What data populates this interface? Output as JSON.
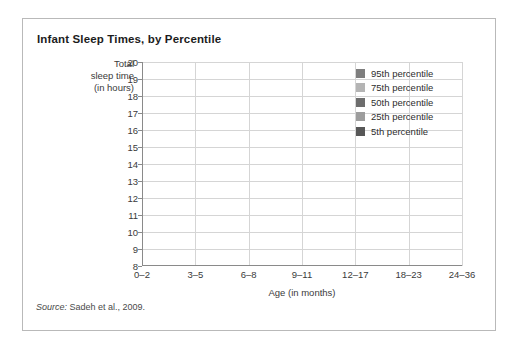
{
  "figure": {
    "title": "Infant Sleep Times, by Percentile",
    "source_label": "Source:",
    "source_text": " Sadeh et al., 2009."
  },
  "axes": {
    "y_title_line1": "Total",
    "y_title_line2": "sleep time",
    "y_title_line3": "(in hours)",
    "x_title": "Age (in months)"
  },
  "legend": {
    "items": [
      {
        "label": "95th percentile",
        "color": "#7e7e7e"
      },
      {
        "label": "75th percentile",
        "color": "#b4b4b4"
      },
      {
        "label": "50th percentile",
        "color": "#6d6d6d"
      },
      {
        "label": "25th percentile",
        "color": "#9d9d9d"
      },
      {
        "label": "5th percentile",
        "color": "#575757"
      }
    ]
  },
  "chart_data": {
    "type": "line",
    "title": "Infant Sleep Times, by Percentile",
    "xlabel": "Age (in months)",
    "ylabel": "Total sleep time (in hours)",
    "categories": [
      "0–2",
      "3–5",
      "6–8",
      "9–11",
      "12–17",
      "18–23",
      "24–36"
    ],
    "ylim": [
      8,
      20
    ],
    "yticks": [
      8,
      9,
      10,
      11,
      12,
      13,
      14,
      15,
      16,
      17,
      18,
      19,
      20
    ],
    "grid": true,
    "legend_position": "upper-right-inside",
    "series": [
      {
        "name": "95th percentile",
        "color": "#7e7e7e",
        "values": [
          19.0,
          16.2,
          15.8,
          15.4,
          15.0,
          14.9,
          14.1
        ]
      },
      {
        "name": "75th percentile",
        "color": "#b4b4b4",
        "values": [
          16.1,
          14.8,
          14.1,
          14.1,
          14.1,
          14.1,
          13.1
        ]
      },
      {
        "name": "50th percentile",
        "color": "#6d6d6d",
        "values": [
          14.4,
          13.4,
          12.9,
          12.8,
          13.0,
          13.0,
          12.1
        ]
      },
      {
        "name": "25th percentile",
        "color": "#9d9d9d",
        "values": [
          12.0,
          12.0,
          12.0,
          12.0,
          12.0,
          11.9,
          11.2
        ]
      },
      {
        "name": "5th percentile",
        "color": "#575757",
        "values": [
          9.3,
          9.9,
          9.6,
          10.0,
          10.2,
          10.2,
          9.35
        ]
      }
    ]
  }
}
